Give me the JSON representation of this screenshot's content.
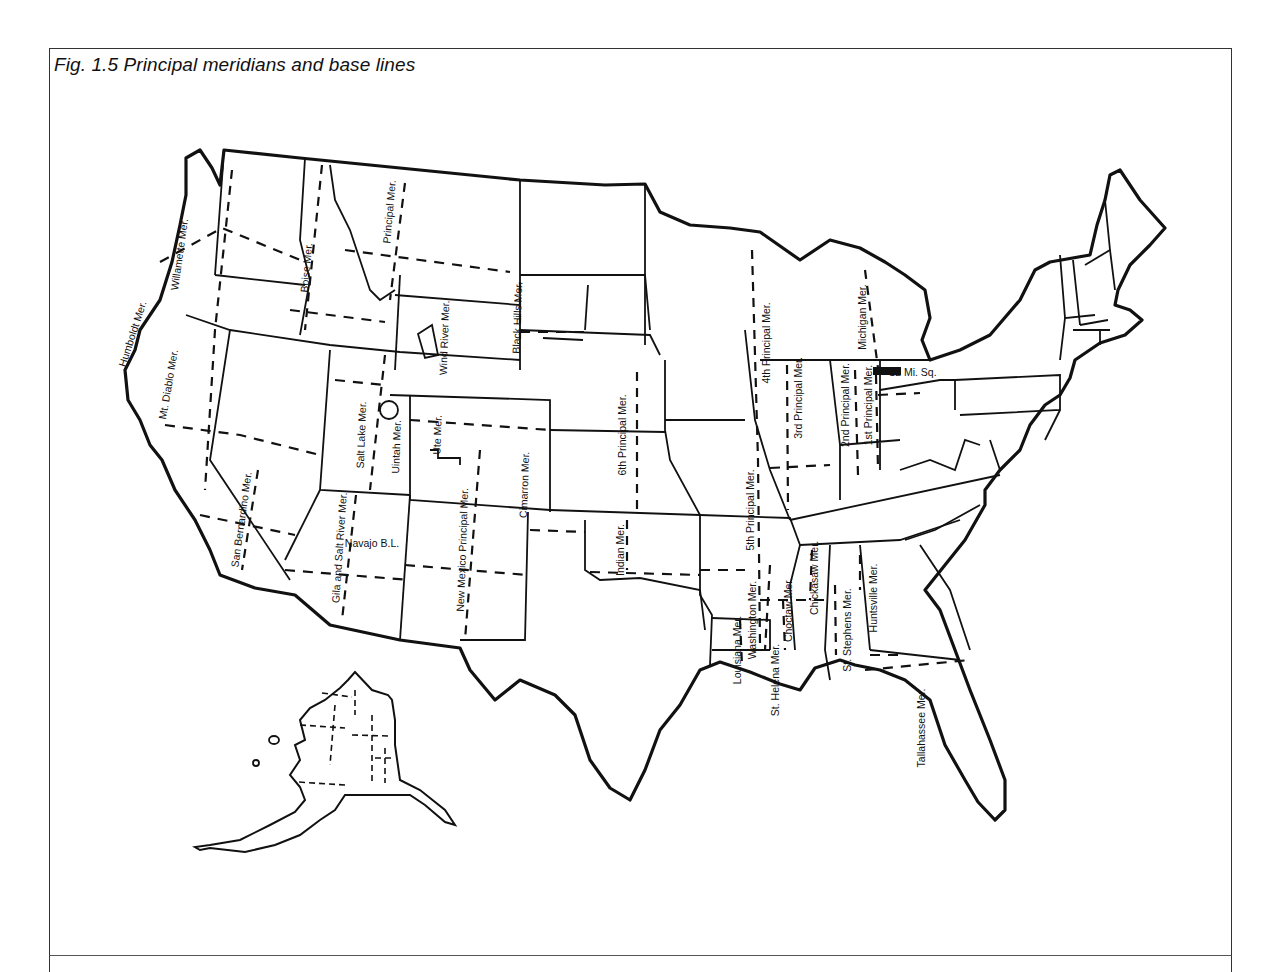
{
  "figure": {
    "caption": "Fig. 1.5  Principal meridians and base lines"
  },
  "meridian_labels": [
    {
      "text": "Humboldt Mer.",
      "x": 136,
      "y": 335,
      "rot": -72
    },
    {
      "text": "Willamette Mer.",
      "x": 183,
      "y": 255,
      "rot": -82
    },
    {
      "text": "Mt. Diablo Mer.",
      "x": 172,
      "y": 385,
      "rot": -80
    },
    {
      "text": "Boise Mer.",
      "x": 310,
      "y": 268,
      "rot": -85
    },
    {
      "text": "Principal Mer.",
      "x": 393,
      "y": 212,
      "rot": -85
    },
    {
      "text": "Wind River Mer.",
      "x": 448,
      "y": 338,
      "rot": -88
    },
    {
      "text": "Black Hills Mer.",
      "x": 521,
      "y": 318,
      "rot": -88
    },
    {
      "text": "Salt Lake Mer.",
      "x": 365,
      "y": 435,
      "rot": -88
    },
    {
      "text": "Uintah Mer.",
      "x": 400,
      "y": 447,
      "rot": -88
    },
    {
      "text": "Ute Mer.",
      "x": 441,
      "y": 435,
      "rot": -88
    },
    {
      "text": "San Bernardino Mer.",
      "x": 245,
      "y": 520,
      "rot": -82
    },
    {
      "text": "Gila and Salt River Mer.",
      "x": 343,
      "y": 548,
      "rot": -86
    },
    {
      "text": "New Mexico Principal Mer.",
      "x": 466,
      "y": 550,
      "rot": -88
    },
    {
      "text": "Cimarron Mer.",
      "x": 528,
      "y": 485,
      "rot": -88
    },
    {
      "text": "Indian Mer.",
      "x": 624,
      "y": 550,
      "rot": -90
    },
    {
      "text": "6th Principal Mer.",
      "x": 626,
      "y": 435,
      "rot": -90
    },
    {
      "text": "5th Principal Mer.",
      "x": 754,
      "y": 510,
      "rot": -90
    },
    {
      "text": "4th Principal Mer.",
      "x": 770,
      "y": 343,
      "rot": -90
    },
    {
      "text": "3rd Principal Mer.",
      "x": 802,
      "y": 398,
      "rot": -90
    },
    {
      "text": "2nd Principal Mer.",
      "x": 849,
      "y": 405,
      "rot": -90
    },
    {
      "text": "1st Principal Mer.",
      "x": 872,
      "y": 405,
      "rot": -90
    },
    {
      "text": "Michigan Mer.",
      "x": 866,
      "y": 317,
      "rot": -90
    },
    {
      "text": "Washington Mer.",
      "x": 756,
      "y": 620,
      "rot": -90
    },
    {
      "text": "Louisiana Mer.",
      "x": 741,
      "y": 650,
      "rot": -90
    },
    {
      "text": "St. Helena Mer.",
      "x": 779,
      "y": 680,
      "rot": -90
    },
    {
      "text": "Choctaw Mer.",
      "x": 792,
      "y": 610,
      "rot": -90
    },
    {
      "text": "Chickasaw Mer.",
      "x": 818,
      "y": 578,
      "rot": -90
    },
    {
      "text": "St. Stephens Mer.",
      "x": 851,
      "y": 630,
      "rot": -90
    },
    {
      "text": "Huntsville Mer.",
      "x": 877,
      "y": 598,
      "rot": -90
    },
    {
      "text": "Tallahassee Mer.",
      "x": 925,
      "y": 728,
      "rot": -90
    }
  ],
  "other_labels": [
    {
      "text": "Navajo B.L.",
      "x": 372,
      "y": 547,
      "rot": 0
    },
    {
      "text": "12 Mi. Sq.",
      "x": 913,
      "y": 376,
      "rot": 0
    }
  ],
  "colors": {
    "ink": "#111111",
    "paper": "#ffffff",
    "frame": "#333333"
  }
}
